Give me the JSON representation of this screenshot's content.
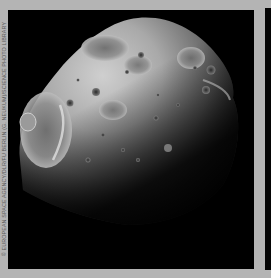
{
  "image": {
    "subject": "Phobos (moon of Mars), grayscale cratered surface",
    "credit": "© EUROPEAN SPACE AGENCY/DLR/FU BERLIN (G. NEUKUM)/SCIENCE PHOTO LIBRARY"
  },
  "colors": {
    "frame": "#b4b4b4",
    "background": "#000000",
    "surface_light": "#c8c8c8",
    "surface_mid": "#8a8a8a",
    "surface_dark": "#3a3a3a"
  }
}
